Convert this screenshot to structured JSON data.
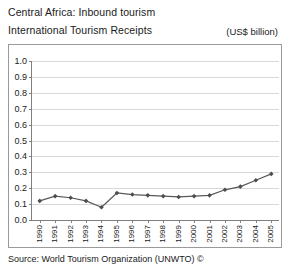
{
  "header": {
    "title_line1": "Central Africa: Inbound tourism",
    "title_line2": "International Tourism Receipts",
    "units_label": "(US$ billion)"
  },
  "footer": {
    "source": "Source: World Tourism Organization (UNWTO) ©"
  },
  "style": {
    "line_color": "#595959",
    "marker_color": "#4d4d4d",
    "grid_color": "#d8d8d8",
    "axis_color": "#808080",
    "frame_color": "#9a9a9a",
    "background": "#ffffff"
  },
  "chart_data": {
    "type": "line",
    "xlabel": "",
    "ylabel": "",
    "units": "US$ billion",
    "grid": "horizontal",
    "legend": "none",
    "ylim": [
      0.0,
      1.0
    ],
    "yticks": [
      "0.0",
      "0.1",
      "0.2",
      "0.3",
      "0.4",
      "0.5",
      "0.6",
      "0.7",
      "0.8",
      "0.9",
      "1.0"
    ],
    "ytick_values": [
      0.0,
      0.1,
      0.2,
      0.3,
      0.4,
      0.5,
      0.6,
      0.7,
      0.8,
      0.9,
      1.0
    ],
    "categories": [
      "1990",
      "1991",
      "1992",
      "1993",
      "1994",
      "1995",
      "1996",
      "1997",
      "1998",
      "1999",
      "2000",
      "2001",
      "2002",
      "2003",
      "2004",
      "2005"
    ],
    "values": [
      0.12,
      0.15,
      0.14,
      0.12,
      0.08,
      0.17,
      0.16,
      0.155,
      0.15,
      0.145,
      0.15,
      0.155,
      0.19,
      0.21,
      0.25,
      0.29
    ],
    "series": [
      {
        "name": "International Tourism Receipts",
        "values": [
          0.12,
          0.15,
          0.14,
          0.12,
          0.08,
          0.17,
          0.16,
          0.155,
          0.15,
          0.145,
          0.15,
          0.155,
          0.19,
          0.21,
          0.25,
          0.29
        ]
      }
    ]
  }
}
